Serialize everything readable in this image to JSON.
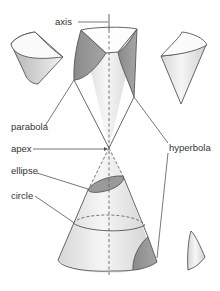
{
  "diagram": {
    "labels": {
      "axis": "axis",
      "parabola": "parabola",
      "apex": "apex",
      "hyperbola": "hyperbola",
      "ellipse": "ellipse",
      "circle": "circle"
    },
    "colors": {
      "stroke": "#555555",
      "dark_face": "#8f8f8f",
      "light_face": "#e8e8e8",
      "label": "#333333"
    }
  }
}
